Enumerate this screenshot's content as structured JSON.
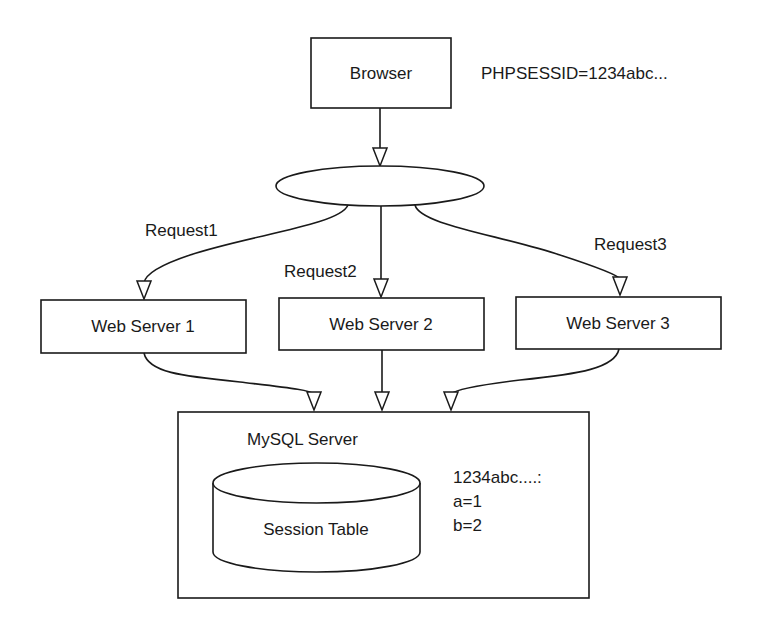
{
  "diagram": {
    "browser": {
      "label": "Browser"
    },
    "cookie_label": "PHPSESSID=1234abc...",
    "load_balancer": {
      "label": ""
    },
    "requests": [
      {
        "label": "Request1"
      },
      {
        "label": "Request2"
      },
      {
        "label": "Request3"
      }
    ],
    "web_servers": [
      {
        "label": "Web Server 1"
      },
      {
        "label": "Web Server 2"
      },
      {
        "label": "Web Server 3"
      }
    ],
    "mysql_server": {
      "label": "MySQL Server",
      "table": {
        "label": "Session Table"
      },
      "session_data": {
        "key": "1234abc....:",
        "lines": [
          "a=1",
          "b=2"
        ]
      }
    },
    "colors": {
      "stroke": "#1a1a1a",
      "background": "#ffffff"
    }
  }
}
